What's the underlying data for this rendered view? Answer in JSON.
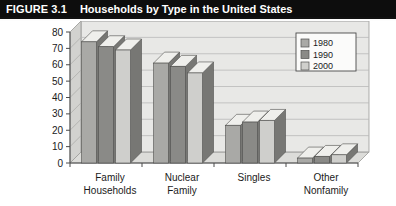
{
  "figure": {
    "number": "FIGURE 3.1",
    "title": "Households by Type in the United States"
  },
  "colors": {
    "title_bar_bg": "#0d0d0d",
    "title_bar_text": "#ffffff",
    "panel_bg": "#e8e8e6",
    "panel_wall": "#d2d2cf",
    "series_1980": "#a9a9a6",
    "series_1990": "#8a8a87",
    "series_2000": "#cfcfcc",
    "gridline": "#b9b9b9",
    "axis": "#4a4a4a"
  },
  "chart_data": {
    "type": "bar",
    "title": "Households by Type in the United States",
    "xlabel": "",
    "ylabel": "",
    "ylim": [
      0,
      80
    ],
    "yticks": [
      0,
      10,
      20,
      30,
      40,
      50,
      60,
      70,
      80
    ],
    "grid": true,
    "legend_position": "top-right",
    "categories": [
      "Family Households",
      "Nuclear Family",
      "Singles",
      "Other Nonfamily"
    ],
    "category_lines": [
      [
        "Family",
        "Households"
      ],
      [
        "Nuclear",
        "Family"
      ],
      [
        "Singles",
        ""
      ],
      [
        "Other",
        "Nonfamily"
      ]
    ],
    "series": [
      {
        "name": "1980",
        "values": [
          74,
          61,
          23,
          3
        ]
      },
      {
        "name": "1990",
        "values": [
          71,
          59,
          25,
          4
        ]
      },
      {
        "name": "2000",
        "values": [
          69,
          55,
          26,
          5
        ]
      }
    ]
  }
}
